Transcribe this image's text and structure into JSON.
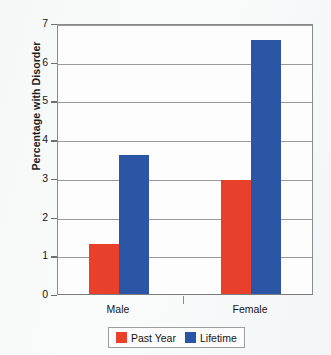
{
  "chart_data": {
    "type": "bar",
    "title": "",
    "xlabel": "",
    "ylabel": "Percentage with Disorder",
    "categories": [
      "Male",
      "Female"
    ],
    "series": [
      {
        "name": "Past Year",
        "color": "#e8402a",
        "values": [
          1.3,
          2.95
        ]
      },
      {
        "name": "Lifetime",
        "color": "#2b55a5",
        "values": [
          3.6,
          6.55
        ]
      }
    ],
    "ylim": [
      0,
      7
    ],
    "ytick_labels": [
      "7",
      "6",
      "5",
      "4",
      "3",
      "2",
      "1",
      "0"
    ],
    "ytick_values": [
      7,
      6,
      5,
      4,
      3,
      2,
      1,
      0
    ],
    "grid": true,
    "legend_position": "bottom"
  },
  "axis": {
    "y_title": "Percentage with Disorder"
  },
  "legend": {
    "entries": [
      {
        "label": "Past Year"
      },
      {
        "label": "Lifetime"
      }
    ]
  }
}
